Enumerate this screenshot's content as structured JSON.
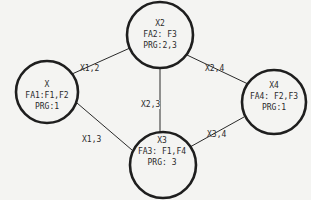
{
  "nodes": [
    {
      "id": "x1",
      "title": "X",
      "fa": "FA1:F1,F2",
      "prg": "PRG:1",
      "cx": 47,
      "cy": 92,
      "r": 31
    },
    {
      "id": "x2",
      "title": "X2",
      "fa": "FA2: F3",
      "prg": "PRG:2,3",
      "cx": 160,
      "cy": 35,
      "r": 33
    },
    {
      "id": "x3",
      "title": "X3",
      "fa": "FA3: F1,F4",
      "prg": "PRG: 3",
      "cx": 163,
      "cy": 165,
      "r": 33
    },
    {
      "id": "x4",
      "title": "X4",
      "fa": "FA4: F2,F3",
      "prg": "PRG:1",
      "cx": 274,
      "cy": 102,
      "r": 32
    }
  ],
  "edges": [
    {
      "from": "x1",
      "to": "x2",
      "label": "X1,2"
    },
    {
      "from": "x1",
      "to": "x3",
      "label": "X1,3"
    },
    {
      "from": "x2",
      "to": "x3",
      "label": "X2,3"
    },
    {
      "from": "x2",
      "to": "x4",
      "label": "X2,4"
    },
    {
      "from": "x3",
      "to": "x4",
      "label": "X3,4"
    }
  ],
  "colors": {
    "line": "#2a2a2a",
    "background": "#f4f4f2"
  }
}
